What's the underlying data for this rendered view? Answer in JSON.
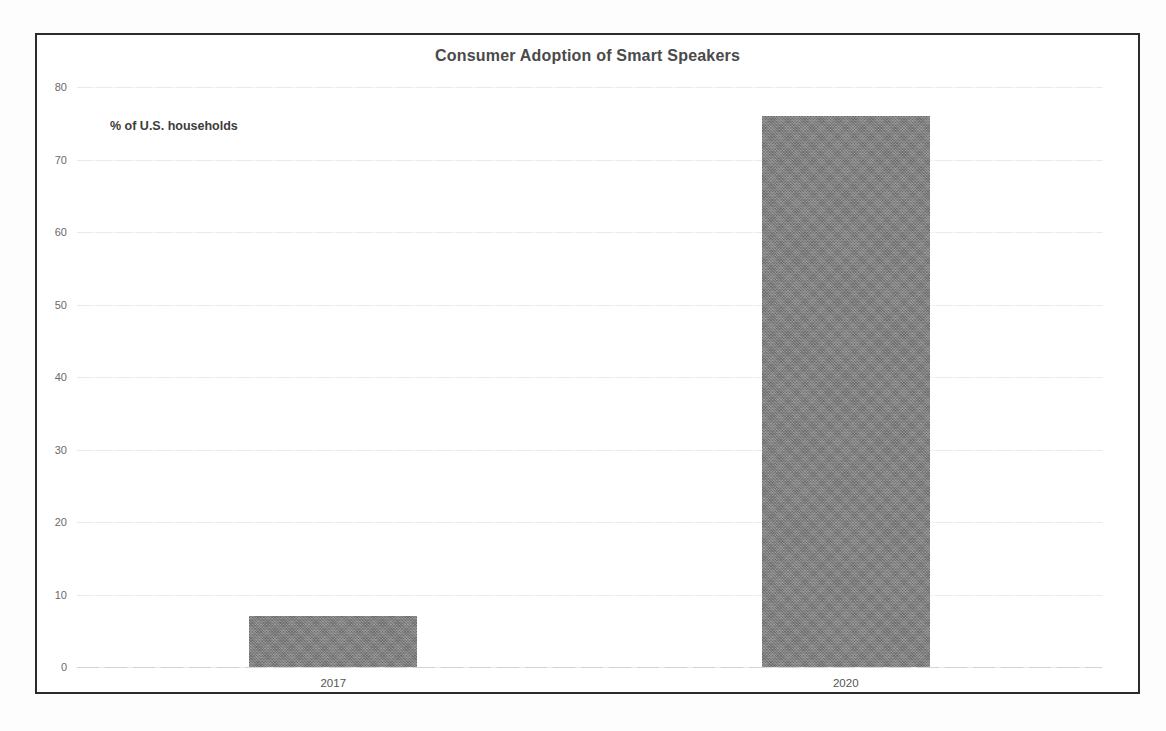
{
  "chart_data": {
    "type": "bar",
    "title": "Consumer Adoption of Smart Speakers",
    "categories": [
      "2017",
      "2020"
    ],
    "values": [
      7,
      76
    ],
    "xlabel": "",
    "ylabel": "% of U.S. households",
    "ylim": [
      0,
      80
    ],
    "yticks": [
      0,
      10,
      20,
      30,
      40,
      50,
      60,
      70,
      80
    ],
    "ytick_labels": [
      "0",
      "10",
      "20",
      "30",
      "40",
      "50",
      "60",
      "70",
      "80"
    ],
    "grid": true,
    "legend": false,
    "legend_position": "none",
    "series": [
      {
        "name": "% of U.S. households",
        "color": "#808080",
        "values": [
          7,
          76
        ]
      }
    ],
    "annotations": [
      {
        "name": "y-axis-caption",
        "text": "% of U.S. households"
      }
    ]
  },
  "frame": {
    "border_color": "#2b2b2b",
    "background": "#ffffff"
  },
  "style": {
    "title_color": "#4a4a4a",
    "tick_color": "#6b6b6b",
    "grid_color": "#ececec",
    "bar_color": "#808080"
  }
}
